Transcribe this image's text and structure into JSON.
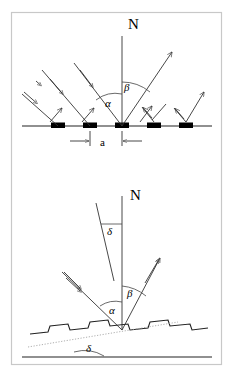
{
  "figure": {
    "background_color": "#ffffff",
    "frame_color": "#c8c8c8",
    "line_color": "#333333",
    "marker_color": "#000000",
    "panels": [
      {
        "id": "top-panel",
        "name": "flat-grating-panel",
        "description": "Flat surface with periodic scatterers, incident beam and diffracted beams",
        "labels": [
          {
            "key": "normal",
            "text": "N",
            "x": 128,
            "y": 29,
            "class": "lbl-normal"
          },
          {
            "key": "alpha",
            "text": "α",
            "x": 108,
            "y": 106,
            "class": "lbl-greek"
          },
          {
            "key": "beta",
            "text": "β",
            "x": 126,
            "y": 90,
            "class": "lbl-greek"
          },
          {
            "key": "period",
            "text": "a",
            "x": 100,
            "y": 147,
            "class": "lbl-dim"
          }
        ],
        "scatterer_count": 5,
        "scatterer_centers_x": [
          58,
          90,
          122,
          154,
          186
        ],
        "surface_y": 126,
        "normal_x": 122,
        "normal_top_y": 36
      },
      {
        "id": "bottom-panel",
        "name": "tilted-rough-surface-panel",
        "description": "Tilted sawtooth surface, local normal N, tilt angle delta, incident and reflected rays",
        "labels": [
          {
            "key": "normal",
            "text": "N",
            "x": 130,
            "y": 199,
            "class": "lbl-normal"
          },
          {
            "key": "delta_top",
            "text": "δ",
            "x": 110,
            "y": 232,
            "class": "lbl-greek"
          },
          {
            "key": "alpha",
            "text": "α",
            "x": 112,
            "y": 312,
            "class": "lbl-greek"
          },
          {
            "key": "beta",
            "text": "β",
            "x": 129,
            "y": 295,
            "class": "lbl-greek"
          },
          {
            "key": "delta_bottom",
            "text": "δ",
            "x": 89,
            "y": 348,
            "class": "lbl-greek"
          }
        ],
        "normal_x": 122,
        "normal_top_y": 196,
        "vertex_x": 122,
        "vertex_y": 330,
        "baseline_y": 357
      }
    ],
    "symbols": {
      "normal_label": "N",
      "incidence_angle": "α",
      "scattering_angle": "β",
      "tilt_angle": "δ",
      "period_label": "a"
    }
  }
}
